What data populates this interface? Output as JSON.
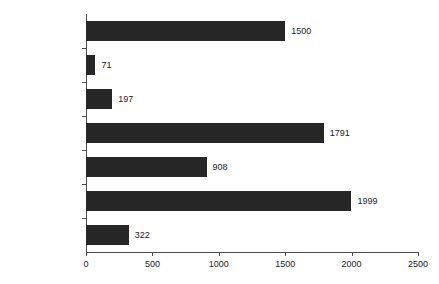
{
  "chart_data": {
    "type": "bar",
    "orientation": "horizontal",
    "title": "",
    "xlabel": "",
    "ylabel": "",
    "xlim": [
      0,
      2500
    ],
    "xticks": [
      0,
      500,
      1000,
      1500,
      2000,
      2500
    ],
    "xtick_labels": [
      "0",
      "500",
      "1000",
      "1500",
      "2000",
      "2500"
    ],
    "grid": false,
    "legend": false,
    "bar_color": "#262626",
    "axis_color": "#4d4d4d",
    "categories": [
      "IND",
      "验证性临床\n试验申请",
      "NDA",
      "ANDA",
      "一致性评价申请",
      "补充申请",
      "境外生产药品\n再注册申请"
    ],
    "values": [
      1500,
      71,
      197,
      1791,
      908,
      1999,
      322
    ],
    "value_labels": [
      "1500",
      "71",
      "197",
      "1791",
      "908",
      "1999",
      "322"
    ]
  }
}
